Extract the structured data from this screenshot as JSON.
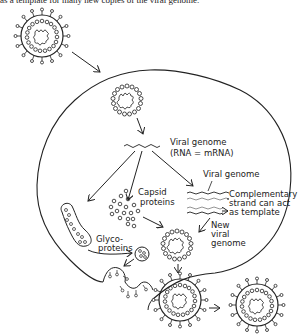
{
  "caption": "as a template for many new copies of the viral genome.",
  "labels": {
    "viral_genome_1": "Viral genome",
    "viral_genome_1_sub": "(RNA = mRNA)",
    "capsid_1": "Capsid",
    "capsid_2": "proteins",
    "viral_genome_2": "Viral genome",
    "complementary_1": "Complementary",
    "complementary_2": "strand can act",
    "complementary_3": "as template",
    "new_viral_1": "New",
    "new_viral_2": "viral",
    "new_viral_3": "genome",
    "glyco_1": "Glyco-",
    "glyco_2": "proteins"
  },
  "colors": {
    "ink": "#222222",
    "background": "#ffffff"
  }
}
